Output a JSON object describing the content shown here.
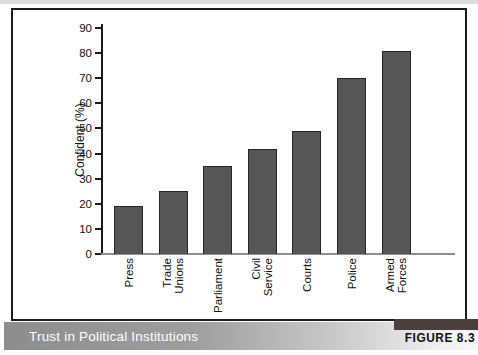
{
  "figure_label": "FIGURE 8.3",
  "caption": "Trust in Political Institutions",
  "chart_data": {
    "type": "bar",
    "categories": [
      "Press",
      "Trade Unions",
      "Parliament",
      "Civil Service",
      "Courts",
      "Police",
      "Armed Forces"
    ],
    "values": [
      19,
      25,
      35,
      42,
      49,
      70,
      81
    ],
    "title": "Trust in Political Institutions",
    "xlabel": "",
    "ylabel": "Confident (%)",
    "ylim": [
      0,
      90
    ],
    "yticks": [
      0,
      10,
      20,
      30,
      40,
      50,
      60,
      70,
      80,
      90
    ],
    "grid": false,
    "legend": "none",
    "bar_orientation": "vertical"
  },
  "colors": {
    "bar_fill": "#565656",
    "bar_border": "#262626",
    "frame_border": "#1c1c1c",
    "axis": "#1c1c1c",
    "baseline": "#8f8f8f",
    "caption_bar_start": "#8d8d8d",
    "caption_bar_end": "#f7f7f7",
    "caption_text": "#ffffff",
    "figure_block": "#4b403e",
    "figure_label_text": "#111111"
  }
}
